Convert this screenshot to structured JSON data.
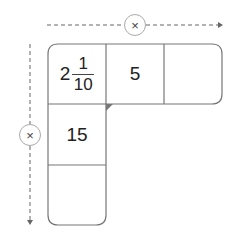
{
  "diagram": {
    "operator_horizontal": "×",
    "operator_vertical": "×",
    "cells": {
      "r0c0": {
        "whole": "2",
        "numerator": "1",
        "denominator": "10"
      },
      "r0c1": "5",
      "r0c2": "",
      "r1c0": "15",
      "r2c0": ""
    },
    "colors": {
      "line": "#777777",
      "arrow": "#666666",
      "circle_border": "#aaaaaa",
      "text": "#222222"
    }
  }
}
